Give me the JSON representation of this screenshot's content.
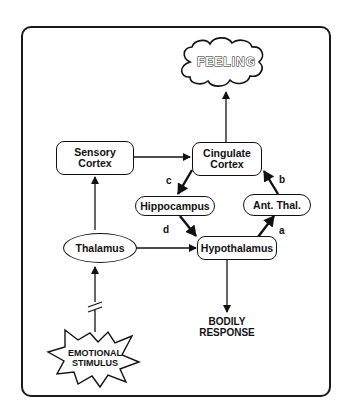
{
  "diagram": {
    "type": "papez-circuit-emotion",
    "nodes": {
      "feeling": "FEELING",
      "sensory_cortex": "Sensory\nCortex",
      "cingulate_cortex": "Cingulate\nCortex",
      "hippocampus": "Hippocampus",
      "ant_thal": "Ant. Thal.",
      "thalamus": "Thalamus",
      "hypothalamus": "Hypothalamus",
      "bodily_response": "BODILY\nRESPONSE",
      "emotional_stimulus": "EMOTIONAL\nSTIMULUS"
    },
    "edge_labels": {
      "a": "a",
      "b": "b",
      "c": "c",
      "d": "d"
    },
    "edges": [
      {
        "from": "emotional_stimulus",
        "to": "thalamus",
        "style": "broken"
      },
      {
        "from": "thalamus",
        "to": "sensory_cortex"
      },
      {
        "from": "thalamus",
        "to": "hypothalamus"
      },
      {
        "from": "sensory_cortex",
        "to": "cingulate_cortex"
      },
      {
        "from": "cingulate_cortex",
        "to": "feeling"
      },
      {
        "from": "cingulate_cortex",
        "to": "hippocampus",
        "label": "c"
      },
      {
        "from": "hippocampus",
        "to": "hypothalamus",
        "label": "d"
      },
      {
        "from": "hypothalamus",
        "to": "ant_thal",
        "label": "a"
      },
      {
        "from": "ant_thal",
        "to": "cingulate_cortex",
        "label": "b"
      },
      {
        "from": "hypothalamus",
        "to": "bodily_response"
      }
    ]
  }
}
